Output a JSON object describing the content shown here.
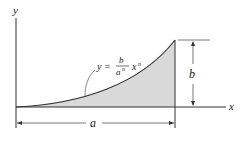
{
  "diagram": {
    "axes": {
      "x_label": "x",
      "y_label": "y"
    },
    "curve": {
      "equation_lhs": "y =",
      "equation_numerator": "b",
      "equation_denominator_base": "a",
      "equation_denominator_exp": "n",
      "equation_var": "x",
      "equation_var_exp": "n"
    },
    "dimensions": {
      "width_label": "a",
      "height_label": "b"
    },
    "colors": {
      "fill": "#d9d9d9",
      "line": "#333333",
      "background": "#ffffff"
    }
  }
}
